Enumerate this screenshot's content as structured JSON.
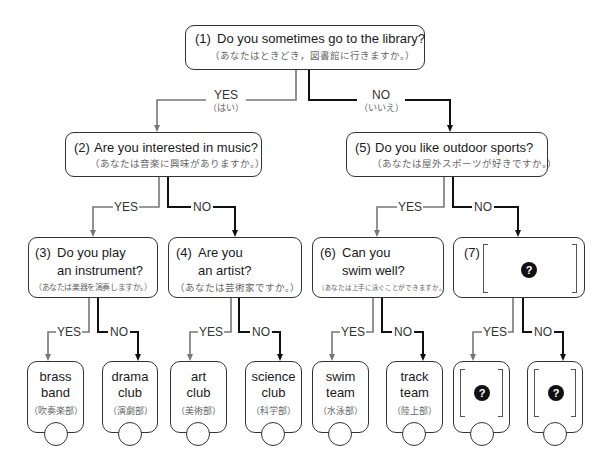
{
  "q1": {
    "number": "(1)",
    "text": "Do you sometimes go to the library?",
    "ja": "（あなたはときどき，図書館に行きますか。）",
    "yes": "YES",
    "yes_ja": "（はい）",
    "no": "NO",
    "no_ja": "（いいえ）"
  },
  "q2": {
    "number": "(2)",
    "text": "Are you interested in music?",
    "ja": "（あなたは音楽に興味がありますか。）",
    "yes": "YES",
    "no": "NO"
  },
  "q3": {
    "number": "(3)",
    "line1": "Do you play",
    "line2": "an instrument?",
    "ja": "（あなたは楽器を演奏しますか。）",
    "yes": "YES",
    "no": "NO"
  },
  "q4": {
    "number": "(4)",
    "line1": "Are you",
    "line2": "an artist?",
    "ja": "（あなたは芸術家ですか。）",
    "yes": "YES",
    "no": "NO"
  },
  "q5": {
    "number": "(5)",
    "text": "Do you like outdoor sports?",
    "ja": "（あなたは屋外スポーツが好きですか。）",
    "yes": "YES",
    "no": "NO"
  },
  "q6": {
    "number": "(6)",
    "line1": "Can you",
    "line2": "swim well?",
    "ja": "（あなたは上手に泳ぐことができますか。）",
    "yes": "YES",
    "no": "NO"
  },
  "q7": {
    "number": "(7)",
    "blank_icon": "?",
    "yes": "YES",
    "no": "NO"
  },
  "results": [
    {
      "line1": "brass",
      "line2": "band",
      "ja": "（吹奏楽部）"
    },
    {
      "line1": "drama",
      "line2": "club",
      "ja": "（演劇部）"
    },
    {
      "line1": "art",
      "line2": "club",
      "ja": "（美術部）"
    },
    {
      "line1": "science",
      "line2": "club",
      "ja": "（科学部）"
    },
    {
      "line1": "swim",
      "line2": "team",
      "ja": "（水泳部）"
    },
    {
      "line1": "track",
      "line2": "team",
      "ja": "（陸上部）"
    },
    {
      "blank_icon": "?"
    },
    {
      "blank_icon": "?"
    }
  ],
  "colors": {
    "yes_line": "#777777",
    "no_line": "#111111",
    "box_border": "#333333",
    "ja_text": "#666666",
    "icon_fill": "#111111"
  }
}
